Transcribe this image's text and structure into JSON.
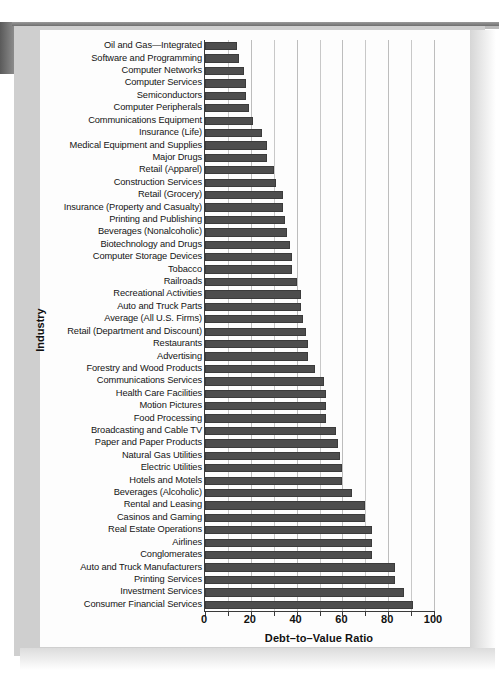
{
  "figure": {
    "bar_color": "#4d4d4d",
    "grid_color": "#c8c8c8",
    "axis_color": "#3a3a3a"
  },
  "chart_data": {
    "type": "bar",
    "orientation": "horizontal",
    "title": "",
    "xlabel": "Debt–to–Value Ratio",
    "ylabel": "Industry",
    "xlim": [
      0,
      100
    ],
    "xticks": [
      0,
      20,
      40,
      60,
      80,
      100
    ],
    "xtick_labels": [
      "0",
      "20",
      "40",
      "60",
      "80",
      "100"
    ],
    "grid": true,
    "grid_spacing": 10,
    "legend": null,
    "categories": [
      "Oil and Gas—Integrated",
      "Software and Programming",
      "Computer Networks",
      "Computer Services",
      "Semiconductors",
      "Computer Peripherals",
      "Communications Equipment",
      "Insurance (Life)",
      "Medical Equipment and Supplies",
      "Major Drugs",
      "Retail (Apparel)",
      "Construction Services",
      "Retail (Grocery)",
      "Insurance (Property and Casualty)",
      "Printing and Publishing",
      "Beverages (Nonalcoholic)",
      "Biotechnology and Drugs",
      "Computer Storage Devices",
      "Tobacco",
      "Railroads",
      "Recreational Activities",
      "Auto and Truck Parts",
      "Average (All U.S. Firms)",
      "Retail (Department and Discount)",
      "Restaurants",
      "Advertising",
      "Forestry and Wood Products",
      "Communications Services",
      "Health Care Facilities",
      "Motion Pictures",
      "Food Processing",
      "Broadcasting and Cable TV",
      "Paper and Paper Products",
      "Natural Gas Utilities",
      "Electric Utilities",
      "Hotels and Motels",
      "Beverages (Alcoholic)",
      "Rental and Leasing",
      "Casinos and Gaming",
      "Real Estate Operations",
      "Airlines",
      "Conglomerates",
      "Auto and Truck Manufacturers",
      "Printing Services",
      "Investment Services",
      "Consumer Financial Services"
    ],
    "values": [
      14,
      15,
      17,
      18,
      18,
      19,
      21,
      25,
      27,
      27,
      30,
      31,
      34,
      34,
      35,
      36,
      37,
      38,
      38,
      40,
      42,
      42,
      43,
      44,
      45,
      45,
      48,
      52,
      53,
      53,
      53,
      57,
      58,
      59,
      60,
      60,
      64,
      70,
      70,
      73,
      73,
      73,
      83,
      83,
      87,
      91
    ]
  }
}
